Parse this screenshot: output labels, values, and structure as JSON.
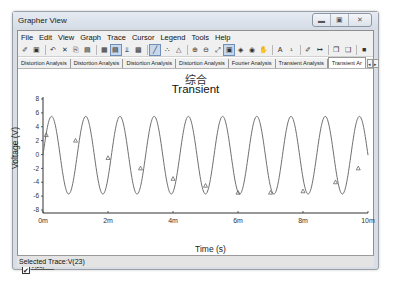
{
  "window": {
    "title": "Grapher View",
    "controls": [
      "minimize",
      "maximize",
      "close"
    ]
  },
  "menubar": {
    "items": [
      "File",
      "Edit",
      "View",
      "Graph",
      "Trace",
      "Cursor",
      "Legend",
      "Tools",
      "Help"
    ]
  },
  "toolbar": {
    "icons": [
      {
        "name": "open-icon",
        "glyph": "✐"
      },
      {
        "name": "save-icon",
        "glyph": "▣"
      },
      {
        "sep": true
      },
      {
        "name": "undo-icon",
        "glyph": "↶"
      },
      {
        "name": "cut-icon",
        "glyph": "✕"
      },
      {
        "name": "copy-icon",
        "glyph": "⎘"
      },
      {
        "name": "paste-icon",
        "glyph": "▤"
      },
      {
        "sep": true
      },
      {
        "name": "grid-icon",
        "glyph": "▦"
      },
      {
        "name": "toggle-legend-icon",
        "glyph": "▤",
        "active": true
      },
      {
        "name": "dual-axes-icon",
        "glyph": "⫫"
      },
      {
        "name": "overlay-icon",
        "glyph": "▩"
      },
      {
        "sep": true
      },
      {
        "name": "plot-line-icon",
        "glyph": "╱",
        "active": true
      },
      {
        "name": "plot-dots-icon",
        "glyph": "∴"
      },
      {
        "name": "plot-markers-icon",
        "glyph": "△"
      },
      {
        "sep": true
      },
      {
        "name": "zoom-in-icon",
        "glyph": "⊕"
      },
      {
        "name": "zoom-out-icon",
        "glyph": "⊖"
      },
      {
        "name": "zoom-fit-icon",
        "glyph": "⤢"
      },
      {
        "name": "cursor-icon",
        "glyph": "▣",
        "active": true
      },
      {
        "name": "cursor-prev-icon",
        "glyph": "◈"
      },
      {
        "name": "cursor-next-icon",
        "glyph": "◉"
      },
      {
        "name": "pan-hand-icon",
        "glyph": "✋"
      },
      {
        "sep": true
      },
      {
        "name": "text-icon",
        "glyph": "A"
      },
      {
        "name": "label-icon",
        "glyph": "¹"
      },
      {
        "sep": true
      },
      {
        "name": "properties-icon",
        "glyph": "✐"
      },
      {
        "name": "export-icon",
        "glyph": "↦"
      },
      {
        "sep": true
      },
      {
        "name": "copy-graph-icon",
        "glyph": "❐"
      },
      {
        "name": "paste-graph-icon",
        "glyph": "❑"
      },
      {
        "sep": true
      },
      {
        "name": "stop-icon",
        "glyph": "■"
      }
    ]
  },
  "tabs": [
    {
      "label": "Distortion Analysis",
      "active": false
    },
    {
      "label": "Distortion Analysis",
      "active": false
    },
    {
      "label": "Distortion Analysis",
      "active": false
    },
    {
      "label": "Distortion Analysis",
      "active": false
    },
    {
      "label": "Fourier Analysis",
      "active": false
    },
    {
      "label": "Transient Analysis",
      "active": false
    },
    {
      "label": "Transient Ar",
      "active": true
    }
  ],
  "tab_scroll": {
    "left": "◂",
    "right": "▸"
  },
  "legend": {
    "checked": "✔",
    "label": "V(23)"
  },
  "status": {
    "text": "Selected Trace:V(23)"
  },
  "chart_data": {
    "type": "line",
    "title": "Transient",
    "subtitle": "综合",
    "xlabel": "Time (s)",
    "ylabel": "Voltage (V)",
    "xlim": [
      0,
      0.01
    ],
    "ylim": [
      -8,
      8
    ],
    "x_ticks": [
      "0m",
      "2m",
      "4m",
      "6m",
      "8m",
      "10m"
    ],
    "y_ticks": [
      "8",
      "6",
      "4",
      "2",
      "0",
      "-2",
      "-4",
      "-6",
      "-8"
    ],
    "grid": false,
    "legend_position": "bottom-left",
    "series": [
      {
        "name": "V(23)",
        "color": "#707070",
        "marker": "triangle",
        "waveform": "sine",
        "frequency_hz": 950,
        "amplitude_v": 5.6,
        "offset_v": -0.1,
        "start_value_v": 0.0,
        "peak_v": 5.5,
        "trough_v": -5.7,
        "marker_points": [
          {
            "x": 0.0001,
            "y": 2.8
          },
          {
            "x": 0.001,
            "y": 2.0
          },
          {
            "x": 0.002,
            "y": -0.5
          },
          {
            "x": 0.003,
            "y": -2.0
          },
          {
            "x": 0.004,
            "y": -3.5
          },
          {
            "x": 0.005,
            "y": -4.5
          },
          {
            "x": 0.006,
            "y": -5.5
          },
          {
            "x": 0.007,
            "y": -5.5
          },
          {
            "x": 0.008,
            "y": -5.3
          },
          {
            "x": 0.009,
            "y": -4.0
          },
          {
            "x": 0.0097,
            "y": -2.0
          }
        ]
      }
    ]
  },
  "colors": {
    "window_frame": "#d9dde4",
    "trace": "#707070",
    "axis": "#333333"
  }
}
